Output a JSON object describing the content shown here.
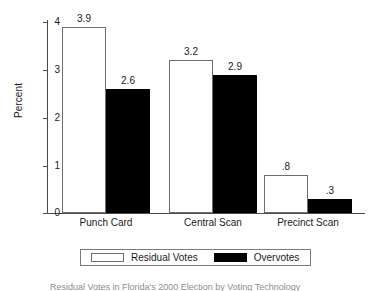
{
  "chart_data": {
    "type": "bar",
    "title": "",
    "xlabel": "",
    "ylabel": "Percent",
    "ylim": [
      0,
      4
    ],
    "yticks": [
      0,
      1,
      2,
      3,
      4
    ],
    "ytick_labels": [
      "0",
      "1",
      "2",
      "3",
      "4"
    ],
    "grid": false,
    "legend_position": "bottom",
    "categories": [
      "Punch Card",
      "Central Scan",
      "Precinct Scan"
    ],
    "series": [
      {
        "name": "Residual Votes",
        "color": "#ffffff",
        "edge_color": "#6e6e6e",
        "values": [
          3.9,
          3.2,
          0.8
        ],
        "labels": [
          "3.9",
          "3.2",
          ".8"
        ]
      },
      {
        "name": "Overvotes",
        "color": "#000000",
        "edge_color": "#000000",
        "values": [
          2.6,
          2.9,
          0.3
        ],
        "labels": [
          "2.6",
          "2.9",
          ".3"
        ]
      }
    ]
  },
  "caption": {
    "text": "Residual Votes in Florida's 2000 Election by Voting Technology"
  }
}
